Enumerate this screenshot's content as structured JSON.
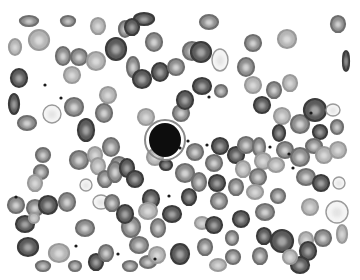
{
  "image": {
    "description": "Grayscale light-microscopy image of a peripheral blood smear showing numerous red blood cells with central pallor and a single dark-stained lymphocyte near the center.",
    "width": 360,
    "height": 280,
    "background": "#ffffff",
    "field_bounds": {
      "x": 10,
      "y": 18,
      "w": 338,
      "h": 254
    }
  },
  "colors": {
    "rbc_dark": "#3a3a3a",
    "rbc_mid": "#6e6e6e",
    "rbc_light": "#9a9a9a",
    "pallor": "#e2e2e2",
    "lymphocyte": "#0e0e0e",
    "lymph_halo": "#8a8a8a",
    "platelet": "#1a1a1a"
  },
  "lymphocyte": {
    "cx": 165,
    "cy": 140,
    "rx": 16,
    "ry": 17
  },
  "cells": [
    {
      "cx": 29,
      "cy": 21,
      "rx": 9,
      "ry": 5,
      "t": "m"
    },
    {
      "cx": 68,
      "cy": 21,
      "rx": 7,
      "ry": 5,
      "t": "m"
    },
    {
      "cx": 98,
      "cy": 26,
      "rx": 7,
      "ry": 8,
      "t": "l"
    },
    {
      "cx": 125,
      "cy": 29,
      "rx": 6,
      "ry": 8,
      "t": "m"
    },
    {
      "cx": 144,
      "cy": 19,
      "rx": 10,
      "ry": 6,
      "t": "d"
    },
    {
      "cx": 209,
      "cy": 22,
      "rx": 9,
      "ry": 7,
      "t": "m"
    },
    {
      "cx": 338,
      "cy": 24,
      "rx": 7,
      "ry": 8,
      "t": "m"
    },
    {
      "cx": 15,
      "cy": 47,
      "rx": 6,
      "ry": 8,
      "t": "l"
    },
    {
      "cx": 39,
      "cy": 40,
      "rx": 10,
      "ry": 10,
      "t": "l"
    },
    {
      "cx": 63,
      "cy": 56,
      "rx": 7,
      "ry": 9,
      "t": "m"
    },
    {
      "cx": 79,
      "cy": 57,
      "rx": 8,
      "ry": 8,
      "t": "m"
    },
    {
      "cx": 96,
      "cy": 61,
      "rx": 9,
      "ry": 9,
      "t": "l"
    },
    {
      "cx": 116,
      "cy": 49,
      "rx": 10,
      "ry": 11,
      "t": "d"
    },
    {
      "cx": 133,
      "cy": 67,
      "rx": 6,
      "ry": 10,
      "t": "m"
    },
    {
      "cx": 142,
      "cy": 79,
      "rx": 9,
      "ry": 9,
      "t": "d"
    },
    {
      "cx": 154,
      "cy": 42,
      "rx": 8,
      "ry": 9,
      "t": "m"
    },
    {
      "cx": 132,
      "cy": 27,
      "rx": 7,
      "ry": 8,
      "t": "d"
    },
    {
      "cx": 160,
      "cy": 72,
      "rx": 8,
      "ry": 9,
      "t": "d"
    },
    {
      "cx": 176,
      "cy": 67,
      "rx": 8,
      "ry": 8,
      "t": "m"
    },
    {
      "cx": 192,
      "cy": 51,
      "rx": 9,
      "ry": 9,
      "t": "m"
    },
    {
      "cx": 201,
      "cy": 52,
      "rx": 10,
      "ry": 10,
      "t": "d"
    },
    {
      "cx": 220,
      "cy": 60,
      "rx": 8,
      "ry": 11,
      "t": "p"
    },
    {
      "cx": 202,
      "cy": 86,
      "rx": 9,
      "ry": 8,
      "t": "d"
    },
    {
      "cx": 221,
      "cy": 91,
      "rx": 6,
      "ry": 6,
      "t": "m"
    },
    {
      "cx": 253,
      "cy": 43,
      "rx": 8,
      "ry": 8,
      "t": "m"
    },
    {
      "cx": 287,
      "cy": 39,
      "rx": 9,
      "ry": 9,
      "t": "l"
    },
    {
      "cx": 246,
      "cy": 67,
      "rx": 8,
      "ry": 9,
      "t": "m"
    },
    {
      "cx": 253,
      "cy": 85,
      "rx": 8,
      "ry": 8,
      "t": "l"
    },
    {
      "cx": 274,
      "cy": 90,
      "rx": 7,
      "ry": 8,
      "t": "m"
    },
    {
      "cx": 290,
      "cy": 83,
      "rx": 7,
      "ry": 8,
      "t": "l"
    },
    {
      "cx": 346,
      "cy": 61,
      "rx": 3,
      "ry": 10,
      "t": "d"
    },
    {
      "cx": 19,
      "cy": 78,
      "rx": 8,
      "ry": 9,
      "t": "d"
    },
    {
      "cx": 72,
      "cy": 75,
      "rx": 8,
      "ry": 8,
      "t": "l"
    },
    {
      "cx": 108,
      "cy": 95,
      "rx": 8,
      "ry": 8,
      "t": "l"
    },
    {
      "cx": 14,
      "cy": 104,
      "rx": 5,
      "ry": 10,
      "t": "d"
    },
    {
      "cx": 27,
      "cy": 123,
      "rx": 9,
      "ry": 7,
      "t": "m"
    },
    {
      "cx": 52,
      "cy": 114,
      "rx": 9,
      "ry": 9,
      "t": "p"
    },
    {
      "cx": 74,
      "cy": 107,
      "rx": 9,
      "ry": 9,
      "t": "m"
    },
    {
      "cx": 86,
      "cy": 130,
      "rx": 8,
      "ry": 11,
      "t": "d"
    },
    {
      "cx": 104,
      "cy": 113,
      "rx": 8,
      "ry": 9,
      "t": "m"
    },
    {
      "cx": 111,
      "cy": 147,
      "rx": 8,
      "ry": 9,
      "t": "m"
    },
    {
      "cx": 119,
      "cy": 165,
      "rx": 8,
      "ry": 8,
      "t": "m"
    },
    {
      "cx": 146,
      "cy": 117,
      "rx": 8,
      "ry": 8,
      "t": "l"
    },
    {
      "cx": 181,
      "cy": 113,
      "rx": 8,
      "ry": 8,
      "t": "m"
    },
    {
      "cx": 185,
      "cy": 100,
      "rx": 8,
      "ry": 9,
      "t": "d"
    },
    {
      "cx": 155,
      "cy": 157,
      "rx": 8,
      "ry": 8,
      "t": "l"
    },
    {
      "cx": 43,
      "cy": 155,
      "rx": 7,
      "ry": 7,
      "t": "m"
    },
    {
      "cx": 41,
      "cy": 172,
      "rx": 7,
      "ry": 7,
      "t": "m"
    },
    {
      "cx": 35,
      "cy": 183,
      "rx": 7,
      "ry": 8,
      "t": "l"
    },
    {
      "cx": 79,
      "cy": 160,
      "rx": 9,
      "ry": 9,
      "t": "m"
    },
    {
      "cx": 95,
      "cy": 155,
      "rx": 7,
      "ry": 8,
      "t": "l"
    },
    {
      "cx": 98,
      "cy": 166,
      "rx": 7,
      "ry": 8,
      "t": "l"
    },
    {
      "cx": 86,
      "cy": 185,
      "rx": 6,
      "ry": 6,
      "t": "p"
    },
    {
      "cx": 105,
      "cy": 179,
      "rx": 7,
      "ry": 8,
      "t": "m"
    },
    {
      "cx": 115,
      "cy": 172,
      "rx": 7,
      "ry": 10,
      "t": "m"
    },
    {
      "cx": 127,
      "cy": 168,
      "rx": 7,
      "ry": 9,
      "t": "d"
    },
    {
      "cx": 135,
      "cy": 179,
      "rx": 8,
      "ry": 8,
      "t": "d"
    },
    {
      "cx": 166,
      "cy": 165,
      "rx": 6,
      "ry": 5,
      "t": "d"
    },
    {
      "cx": 151,
      "cy": 199,
      "rx": 8,
      "ry": 9,
      "t": "d"
    },
    {
      "cx": 148,
      "cy": 211,
      "rx": 9,
      "ry": 8,
      "t": "l"
    },
    {
      "cx": 189,
      "cy": 197,
      "rx": 7,
      "ry": 8,
      "t": "d"
    },
    {
      "cx": 185,
      "cy": 173,
      "rx": 9,
      "ry": 9,
      "t": "m"
    },
    {
      "cx": 195,
      "cy": 152,
      "rx": 8,
      "ry": 8,
      "t": "m"
    },
    {
      "cx": 214,
      "cy": 163,
      "rx": 8,
      "ry": 8,
      "t": "m"
    },
    {
      "cx": 199,
      "cy": 182,
      "rx": 7,
      "ry": 9,
      "t": "m"
    },
    {
      "cx": 220,
      "cy": 146,
      "rx": 8,
      "ry": 8,
      "t": "d"
    },
    {
      "cx": 236,
      "cy": 155,
      "rx": 8,
      "ry": 8,
      "t": "d"
    },
    {
      "cx": 246,
      "cy": 145,
      "rx": 8,
      "ry": 8,
      "t": "m"
    },
    {
      "cx": 217,
      "cy": 183,
      "rx": 8,
      "ry": 8,
      "t": "d"
    },
    {
      "cx": 236,
      "cy": 187,
      "rx": 7,
      "ry": 8,
      "t": "m"
    },
    {
      "cx": 243,
      "cy": 169,
      "rx": 7,
      "ry": 8,
      "t": "l"
    },
    {
      "cx": 259,
      "cy": 147,
      "rx": 6,
      "ry": 9,
      "t": "m"
    },
    {
      "cx": 263,
      "cy": 161,
      "rx": 8,
      "ry": 8,
      "t": "l"
    },
    {
      "cx": 258,
      "cy": 177,
      "rx": 8,
      "ry": 8,
      "t": "m"
    },
    {
      "cx": 255,
      "cy": 192,
      "rx": 8,
      "ry": 7,
      "t": "l"
    },
    {
      "cx": 262,
      "cy": 105,
      "rx": 8,
      "ry": 8,
      "t": "d"
    },
    {
      "cx": 282,
      "cy": 116,
      "rx": 8,
      "ry": 8,
      "t": "l"
    },
    {
      "cx": 300,
      "cy": 124,
      "rx": 9,
      "ry": 9,
      "t": "m"
    },
    {
      "cx": 279,
      "cy": 133,
      "rx": 6,
      "ry": 8,
      "t": "d"
    },
    {
      "cx": 315,
      "cy": 110,
      "rx": 11,
      "ry": 11,
      "t": "d"
    },
    {
      "cx": 333,
      "cy": 110,
      "rx": 7,
      "ry": 6,
      "t": "p"
    },
    {
      "cx": 320,
      "cy": 132,
      "rx": 7,
      "ry": 7,
      "t": "d"
    },
    {
      "cx": 337,
      "cy": 127,
      "rx": 6,
      "ry": 7,
      "t": "m"
    },
    {
      "cx": 314,
      "cy": 146,
      "rx": 8,
      "ry": 7,
      "t": "m"
    },
    {
      "cx": 324,
      "cy": 155,
      "rx": 8,
      "ry": 8,
      "t": "l"
    },
    {
      "cx": 338,
      "cy": 150,
      "rx": 8,
      "ry": 8,
      "t": "l"
    },
    {
      "cx": 285,
      "cy": 150,
      "rx": 8,
      "ry": 8,
      "t": "m"
    },
    {
      "cx": 300,
      "cy": 157,
      "rx": 9,
      "ry": 9,
      "t": "m"
    },
    {
      "cx": 276,
      "cy": 165,
      "rx": 8,
      "ry": 7,
      "t": "l"
    },
    {
      "cx": 306,
      "cy": 177,
      "rx": 9,
      "ry": 8,
      "t": "m"
    },
    {
      "cx": 321,
      "cy": 183,
      "rx": 8,
      "ry": 8,
      "t": "d"
    },
    {
      "cx": 339,
      "cy": 183,
      "rx": 6,
      "ry": 6,
      "t": "p"
    },
    {
      "cx": 278,
      "cy": 196,
      "rx": 7,
      "ry": 7,
      "t": "m"
    },
    {
      "cx": 265,
      "cy": 212,
      "rx": 9,
      "ry": 8,
      "t": "m"
    },
    {
      "cx": 310,
      "cy": 207,
      "rx": 8,
      "ry": 8,
      "t": "l"
    },
    {
      "cx": 337,
      "cy": 212,
      "rx": 11,
      "ry": 11,
      "t": "p"
    },
    {
      "cx": 342,
      "cy": 234,
      "rx": 5,
      "ry": 9,
      "t": "l"
    },
    {
      "cx": 323,
      "cy": 238,
      "rx": 8,
      "ry": 8,
      "t": "m"
    },
    {
      "cx": 282,
      "cy": 241,
      "rx": 11,
      "ry": 11,
      "t": "d"
    },
    {
      "cx": 306,
      "cy": 240,
      "rx": 7,
      "ry": 8,
      "t": "l"
    },
    {
      "cx": 308,
      "cy": 251,
      "rx": 8,
      "ry": 9,
      "t": "d"
    },
    {
      "cx": 260,
      "cy": 256,
      "rx": 7,
      "ry": 8,
      "t": "m"
    },
    {
      "cx": 300,
      "cy": 265,
      "rx": 9,
      "ry": 8,
      "t": "d"
    },
    {
      "cx": 290,
      "cy": 257,
      "rx": 7,
      "ry": 7,
      "t": "l"
    },
    {
      "cx": 16,
      "cy": 205,
      "rx": 8,
      "ry": 8,
      "t": "m"
    },
    {
      "cx": 35,
      "cy": 208,
      "rx": 8,
      "ry": 8,
      "t": "m"
    },
    {
      "cx": 48,
      "cy": 205,
      "rx": 9,
      "ry": 9,
      "t": "d"
    },
    {
      "cx": 25,
      "cy": 224,
      "rx": 9,
      "ry": 8,
      "t": "d"
    },
    {
      "cx": 34,
      "cy": 218,
      "rx": 5,
      "ry": 5,
      "t": "l"
    },
    {
      "cx": 67,
      "cy": 202,
      "rx": 8,
      "ry": 9,
      "t": "m"
    },
    {
      "cx": 85,
      "cy": 228,
      "rx": 9,
      "ry": 8,
      "t": "m"
    },
    {
      "cx": 101,
      "cy": 202,
      "rx": 8,
      "ry": 7,
      "t": "p"
    },
    {
      "cx": 112,
      "cy": 203,
      "rx": 7,
      "ry": 8,
      "t": "m"
    },
    {
      "cx": 28,
      "cy": 247,
      "rx": 10,
      "ry": 9,
      "t": "d"
    },
    {
      "cx": 59,
      "cy": 253,
      "rx": 10,
      "ry": 9,
      "t": "l"
    },
    {
      "cx": 43,
      "cy": 266,
      "rx": 7,
      "ry": 5,
      "t": "m"
    },
    {
      "cx": 75,
      "cy": 266,
      "rx": 6,
      "ry": 5,
      "t": "m"
    },
    {
      "cx": 96,
      "cy": 262,
      "rx": 7,
      "ry": 8,
      "t": "d"
    },
    {
      "cx": 106,
      "cy": 253,
      "rx": 7,
      "ry": 8,
      "t": "m"
    },
    {
      "cx": 131,
      "cy": 227,
      "rx": 9,
      "ry": 10,
      "t": "m"
    },
    {
      "cx": 125,
      "cy": 214,
      "rx": 8,
      "ry": 9,
      "t": "d"
    },
    {
      "cx": 139,
      "cy": 245,
      "rx": 9,
      "ry": 8,
      "t": "m"
    },
    {
      "cx": 148,
      "cy": 262,
      "rx": 8,
      "ry": 6,
      "t": "m"
    },
    {
      "cx": 130,
      "cy": 266,
      "rx": 7,
      "ry": 5,
      "t": "m"
    },
    {
      "cx": 157,
      "cy": 255,
      "rx": 8,
      "ry": 8,
      "t": "l"
    },
    {
      "cx": 180,
      "cy": 254,
      "rx": 9,
      "ry": 10,
      "t": "d"
    },
    {
      "cx": 205,
      "cy": 247,
      "rx": 7,
      "ry": 8,
      "t": "m"
    },
    {
      "cx": 218,
      "cy": 265,
      "rx": 8,
      "ry": 6,
      "t": "l"
    },
    {
      "cx": 233,
      "cy": 257,
      "rx": 7,
      "ry": 7,
      "t": "m"
    },
    {
      "cx": 202,
      "cy": 223,
      "rx": 7,
      "ry": 6,
      "t": "l"
    },
    {
      "cx": 214,
      "cy": 225,
      "rx": 8,
      "ry": 8,
      "t": "d"
    },
    {
      "cx": 172,
      "cy": 214,
      "rx": 9,
      "ry": 8,
      "t": "d"
    },
    {
      "cx": 158,
      "cy": 228,
      "rx": 7,
      "ry": 9,
      "t": "m"
    },
    {
      "cx": 219,
      "cy": 201,
      "rx": 8,
      "ry": 8,
      "t": "m"
    },
    {
      "cx": 241,
      "cy": 219,
      "rx": 8,
      "ry": 8,
      "t": "d"
    },
    {
      "cx": 264,
      "cy": 236,
      "rx": 7,
      "ry": 8,
      "t": "d"
    },
    {
      "cx": 232,
      "cy": 238,
      "rx": 6,
      "ry": 7,
      "t": "m"
    }
  ],
  "platelets": [
    {
      "cx": 45,
      "cy": 85
    },
    {
      "cx": 61,
      "cy": 98
    },
    {
      "cx": 209,
      "cy": 97
    },
    {
      "cx": 16,
      "cy": 197
    },
    {
      "cx": 76,
      "cy": 246
    },
    {
      "cx": 118,
      "cy": 254
    },
    {
      "cx": 155,
      "cy": 259
    },
    {
      "cx": 169,
      "cy": 196
    },
    {
      "cx": 207,
      "cy": 145
    },
    {
      "cx": 270,
      "cy": 147
    },
    {
      "cx": 289,
      "cy": 154
    },
    {
      "cx": 293,
      "cy": 168
    },
    {
      "cx": 188,
      "cy": 141
    },
    {
      "cx": 180,
      "cy": 148
    },
    {
      "cx": 311,
      "cy": 113
    }
  ]
}
